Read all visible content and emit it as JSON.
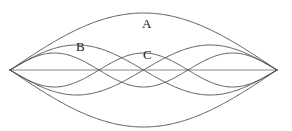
{
  "figure": {
    "type": "standing-wave-harmonics-diagram",
    "caption_labels": [
      "A",
      "B",
      "C"
    ],
    "background_color": "#ffffff",
    "line_color": "#4a4a4a",
    "axis_color": "#6b6b6b",
    "label_color": "#1a1a1a",
    "width": 292,
    "height": 131
  },
  "endpoints": {
    "left": {
      "x": 10,
      "y": 70
    },
    "right": {
      "x": 277,
      "y": 70
    },
    "label_left": "fixed-end-left",
    "label_right": "fixed-end-right"
  },
  "axis": {
    "name": "equilibrium-axis",
    "y": 70,
    "x_start": 10,
    "x_end": 277
  },
  "labels": [
    {
      "text": "A",
      "x": 142,
      "y": 17,
      "name": "label-a"
    },
    {
      "text": "B",
      "x": 76,
      "y": 40,
      "name": "label-b"
    },
    {
      "text": "C",
      "x": 143,
      "y": 48,
      "name": "label-c"
    }
  ],
  "chart_data": {
    "type": "line",
    "title": "",
    "xlabel": "",
    "ylabel": "",
    "xlim": [
      10,
      277
    ],
    "ylim": [
      13,
      127
    ],
    "grid": false,
    "legend": "inline-annotations",
    "annotations": [
      {
        "label": "A",
        "meaning": "fundamental / 1st harmonic",
        "x": 142,
        "y": 17
      },
      {
        "label": "B",
        "meaning": "2nd harmonic",
        "x": 76,
        "y": 40
      },
      {
        "label": "C",
        "meaning": "3rd harmonic",
        "x": 143,
        "y": 48
      }
    ],
    "series": [
      {
        "name": "A",
        "harmonic": 1,
        "antinodes": 1,
        "amplitude_px": 57,
        "baseline_y": 70,
        "branches": [
          "upper",
          "lower"
        ],
        "description": "Fundamental mode: single half-wavelength lens spanning both fixed ends."
      },
      {
        "name": "B",
        "harmonic": 2,
        "antinodes": 2,
        "amplitude_px": 25,
        "baseline_y": 70,
        "branches": [
          "upper",
          "lower"
        ],
        "description": "Second harmonic: two antinodes with one interior node at mid-span."
      },
      {
        "name": "C",
        "harmonic": 3,
        "antinodes": 3,
        "amplitude_px": 17,
        "baseline_y": 70,
        "branches": [
          "upper",
          "lower"
        ],
        "description": "Third harmonic: three antinodes with two interior nodes."
      }
    ],
    "nodes": [
      {
        "series": "B",
        "x": 143.5
      },
      {
        "series": "C",
        "x": 99
      },
      {
        "series": "C",
        "x": 188
      }
    ]
  }
}
